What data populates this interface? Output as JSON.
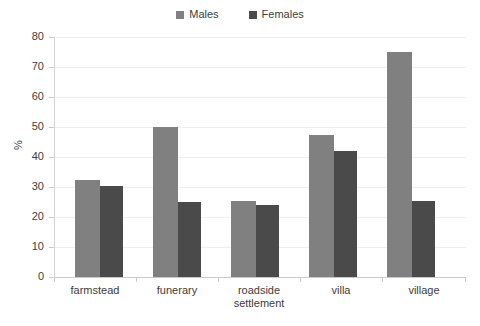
{
  "chart_data": {
    "type": "bar",
    "title": "",
    "xlabel": "",
    "ylabel": "%",
    "ylim": [
      0,
      80
    ],
    "yticks": [
      0,
      10,
      20,
      30,
      40,
      50,
      60,
      70,
      80
    ],
    "grid": true,
    "legend_position": "top-center",
    "categories": [
      "farmstead",
      "funerary",
      "roadside settlement",
      "villa",
      "village"
    ],
    "series": [
      {
        "name": "Males",
        "color": "#808080",
        "values": [
          32.5,
          50.0,
          25.5,
          47.5,
          75.0
        ]
      },
      {
        "name": "Females",
        "color": "#4a4a4a",
        "values": [
          30.2,
          25.0,
          24.0,
          42.0,
          25.2
        ]
      }
    ]
  },
  "legend": {
    "items": [
      {
        "label": "Males",
        "color": "#808080"
      },
      {
        "label": "Females",
        "color": "#4a4a4a"
      }
    ]
  },
  "axes": {
    "y_title": "%",
    "y_tick_labels": [
      "80",
      "70",
      "60",
      "50",
      "40",
      "30",
      "20",
      "10",
      "0"
    ],
    "x_tick_labels": [
      [
        "farmstead"
      ],
      [
        "funerary"
      ],
      [
        "roadside",
        "settlement"
      ],
      [
        "villa"
      ],
      [
        "village"
      ]
    ]
  },
  "colors": {
    "males": "#808080",
    "females": "#4a4a4a",
    "grid": "#efefef",
    "axis": "#c9c9c9",
    "text": "#404040",
    "background": "#ffffff"
  }
}
